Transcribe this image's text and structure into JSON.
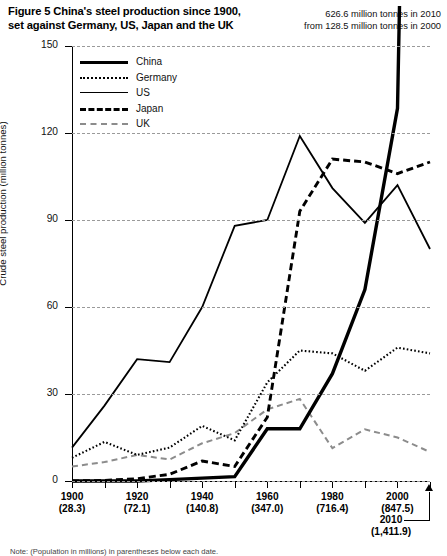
{
  "title": {
    "line1": "Figure 5 China's steel production since 1900,",
    "line2": "set against Germany, US, Japan and the UK"
  },
  "annotation_top": {
    "line1": "626.6 million tonnes in 2010",
    "line2": "from 128.5 million tonnes in 2000"
  },
  "annotation_2010": {
    "year": "2010",
    "population": "(1,411.9)"
  },
  "footnote": "Note: (Population in millions) in parentheses below each date.",
  "legend": [
    {
      "label": "China",
      "style": "thick-solid"
    },
    {
      "label": "Germany",
      "style": "dotted"
    },
    {
      "label": "US",
      "style": "thin-solid"
    },
    {
      "label": "Japan",
      "style": "bold-dashed"
    },
    {
      "label": "UK",
      "style": "gray-dashed"
    }
  ],
  "chart_data": {
    "type": "line",
    "title": "Figure 5 China's steel production since 1900, set against Germany, US, Japan and the UK",
    "xlabel": "",
    "ylabel": "Crude steel production (million tonnes)",
    "ylim": [
      0,
      150
    ],
    "xlim": [
      1900,
      2010
    ],
    "yticks": [
      0,
      30,
      60,
      90,
      120,
      150
    ],
    "ytick_labels": [
      "0",
      "30",
      "60",
      "90",
      "120",
      "150"
    ],
    "grid": true,
    "grid_style": "dashed-horizontal",
    "legend_position": "upper-left-inside",
    "x": [
      1900,
      1910,
      1920,
      1930,
      1940,
      1950,
      1960,
      1970,
      1980,
      1990,
      2000,
      2010
    ],
    "xticks_major": [
      1900,
      1920,
      1940,
      1960,
      1980,
      2000
    ],
    "xtick_labels": [
      {
        "year": "1900",
        "population": "(28.3)"
      },
      {
        "year": "1920",
        "population": "(72.1)"
      },
      {
        "year": "1940",
        "population": "(140.8)"
      },
      {
        "year": "1960",
        "population": "(347.0)"
      },
      {
        "year": "1980",
        "population": "(716.4)"
      },
      {
        "year": "2000",
        "population": "(847.5)"
      }
    ],
    "xticks_minor": [
      1910,
      1930,
      1950,
      1970,
      1990,
      2010
    ],
    "series": [
      {
        "name": "China",
        "style": "thick-solid",
        "color": "#000000",
        "values": [
          0,
          0,
          0,
          0.5,
          1,
          1.5,
          18,
          18,
          37,
          66,
          128.5,
          626.6
        ],
        "clipped_above_axis": true,
        "note": "2010 value 626.6 exceeds the 150 axis maximum; line is drawn clipped at the top"
      },
      {
        "name": "Germany",
        "style": "dotted",
        "color": "#000000",
        "values": [
          8,
          13.5,
          9,
          11.5,
          19,
          14,
          34,
          45,
          44,
          38,
          46,
          44
        ]
      },
      {
        "name": "US",
        "style": "thin-solid",
        "color": "#000000",
        "values": [
          11.5,
          26,
          42,
          41,
          60,
          88,
          90,
          119,
          101,
          89,
          102,
          80
        ]
      },
      {
        "name": "Japan",
        "style": "bold-dashed",
        "color": "#000000",
        "values": [
          0,
          0.2,
          0.8,
          2.3,
          6.9,
          5,
          22,
          93,
          111,
          110,
          106,
          110
        ]
      },
      {
        "name": "UK",
        "style": "gray-dashed",
        "color": "#8c8c8c",
        "values": [
          5,
          6.5,
          9,
          7.4,
          13,
          16.5,
          24.7,
          28.3,
          11.3,
          17.8,
          15,
          10
        ]
      }
    ]
  }
}
